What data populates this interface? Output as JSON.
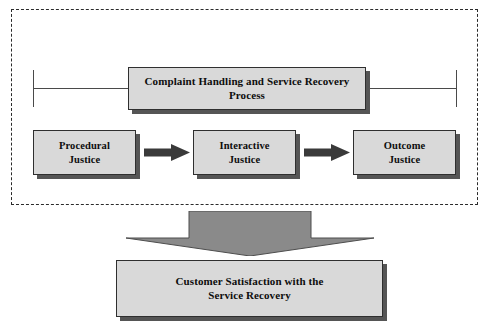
{
  "diagram": {
    "type": "flowchart",
    "title_text_present": false,
    "frame": {
      "style": "dashed",
      "name": "complaint-handling-group"
    },
    "nodes": {
      "top_process": {
        "label_line1": "Complaint Handling and Service Recovery",
        "label_line2": "Process"
      },
      "procedural": {
        "label_line1": "Procedural",
        "label_line2": "Justice"
      },
      "interactive": {
        "label_line1": "Interactive",
        "label_line2": "Justice"
      },
      "outcome": {
        "label_line1": "Outcome",
        "label_line2": "Justice"
      },
      "outcome_result": {
        "label_line1": "Customer Satisfaction with the",
        "label_line2": "Service Recovery"
      }
    },
    "connectors": [
      {
        "name": "arrow-procedural-to-interactive",
        "icon": "right-arrow-icon",
        "direction": "right"
      },
      {
        "name": "arrow-interactive-to-outcome",
        "icon": "right-arrow-icon",
        "direction": "right"
      },
      {
        "name": "arrow-group-to-satisfaction",
        "icon": "down-arrow-icon",
        "direction": "down"
      }
    ],
    "span_bracket": {
      "name": "span-bracket",
      "description": "horizontal span line with end ticks spanning the three justice dimensions"
    },
    "colors": {
      "box_fill": "#d9d9d9",
      "box_border": "#2f2f2f",
      "box_shadow": "#555555",
      "down_arrow_fill": "#8a8a8a",
      "down_arrow_stroke": "#4d4d4d",
      "h_arrow_fill": "#3a3a3a",
      "dashed_frame": "#2b2b2b",
      "span_line": "#4a4a4a",
      "text": "#0d0d0d",
      "background": "#ffffff"
    }
  }
}
